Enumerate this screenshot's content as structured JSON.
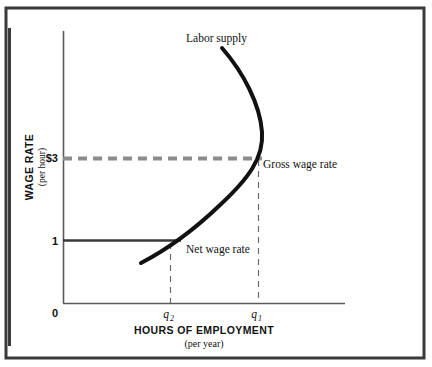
{
  "figure": {
    "kind": "economics-line-chart",
    "background_color": "#ffffff",
    "frame": {
      "name": "outer-border",
      "color": "#3a3a3a",
      "x": 6,
      "y": 8,
      "width": 418,
      "height": 350,
      "stroke_width": 3
    },
    "side_rule": {
      "name": "left-vertical-rule",
      "color": "#3a3a3a",
      "x": 9,
      "y1": 28,
      "y2": 346,
      "stroke_width": 3
    }
  },
  "chart_data": {
    "type": "line",
    "title": "",
    "xlabel": "HOURS OF EMPLOYMENT",
    "xlabel_sub": "(per year)",
    "ylabel": "WAGE RATE",
    "ylabel_sub": "(per hour)",
    "origin_label": "0",
    "x_ticks": [
      {
        "label": "q2",
        "display": "q",
        "subscript": "2",
        "x_px": 170
      },
      {
        "label": "q1",
        "display": "q",
        "subscript": "1",
        "x_px": 258
      }
    ],
    "y_ticks": [
      {
        "label": "$3",
        "value": 3,
        "y_px": 158
      },
      {
        "label": "1",
        "value": 1,
        "y_px": 240
      }
    ],
    "axis_ranges": {
      "x_px": [
        63,
        345
      ],
      "y_px": [
        303,
        31
      ]
    },
    "grid": false,
    "legend_position": "inline-annotations",
    "series": [
      {
        "name": "Labor supply",
        "style": "solid",
        "color": "#111111",
        "stroke_width": 4,
        "shape": "backward-bending",
        "path": "M 141 263 C 168 249 196 228 220 205 C 248 179 264 158 262 132 C 260 104 243 72 222 48",
        "points_px": [
          {
            "x": 141,
            "y": 263
          },
          {
            "x": 170,
            "y": 240
          },
          {
            "x": 220,
            "y": 197
          },
          {
            "x": 262,
            "y": 158
          },
          {
            "x": 262,
            "y": 130
          },
          {
            "x": 222,
            "y": 48
          }
        ]
      }
    ],
    "reference_lines": [
      {
        "name": "gross-wage-line",
        "label": "Gross wage rate",
        "orientation": "horizontal",
        "style": "dashed",
        "color": "#8c8c8c",
        "stroke_width": 4,
        "y_px": 158,
        "x_from": 63,
        "x_to": 262,
        "at_value": "$3"
      },
      {
        "name": "net-wage-line",
        "label": "Net wage rate",
        "orientation": "horizontal",
        "style": "solid",
        "color": "#3a3a3a",
        "stroke_width": 2.5,
        "y_px": 240,
        "x_from": 63,
        "x_to": 181,
        "at_value": "1"
      },
      {
        "name": "q1-dropline",
        "orientation": "vertical",
        "style": "dashed",
        "color": "#6b6b6b",
        "stroke_width": 1.2,
        "x_px": 258,
        "y_from": 160,
        "y_to": 303
      },
      {
        "name": "q2-dropline",
        "orientation": "vertical",
        "style": "dashed",
        "color": "#6b6b6b",
        "stroke_width": 1.2,
        "x_px": 170,
        "y_from": 243,
        "y_to": 303
      }
    ],
    "annotations": [
      {
        "name": "labor-supply-label",
        "text": "Labor supply",
        "x_px": 186,
        "y_px": 42,
        "anchor": "start",
        "font_size": 11.5
      },
      {
        "name": "gross-wage-rate-label",
        "text": "Gross wage rate",
        "x_px": 263,
        "y_px": 168,
        "anchor": "start",
        "font_size": 11.5
      },
      {
        "name": "net-wage-rate-label",
        "text": "Net wage rate",
        "x_px": 186,
        "y_px": 253,
        "anchor": "start",
        "font_size": 11.5
      }
    ]
  }
}
